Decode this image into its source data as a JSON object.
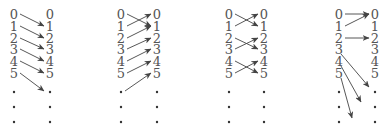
{
  "diagrams": [
    {
      "id": "shift-up",
      "left_x": 14,
      "right_x": 50,
      "labels": [
        "0",
        "1",
        "2",
        "3",
        "4",
        "5"
      ],
      "mapping": [
        [
          0,
          1
        ],
        [
          1,
          2
        ],
        [
          2,
          3
        ],
        [
          3,
          4
        ],
        [
          4,
          5
        ],
        [
          5,
          6
        ]
      ]
    },
    {
      "id": "shift-down",
      "left_x": 121,
      "right_x": 157,
      "labels": [
        "0",
        "1",
        "2",
        "3",
        "4",
        "5"
      ],
      "mapping": [
        [
          0,
          1
        ],
        [
          1,
          0
        ],
        [
          2,
          1
        ],
        [
          3,
          2
        ],
        [
          4,
          3
        ],
        [
          5,
          4
        ],
        [
          6,
          5
        ]
      ]
    },
    {
      "id": "pair-swap",
      "left_x": 229,
      "right_x": 264,
      "labels": [
        "0",
        "1",
        "2",
        "3",
        "4",
        "5"
      ],
      "mapping": [
        [
          0,
          1
        ],
        [
          1,
          0
        ],
        [
          2,
          3
        ],
        [
          3,
          2
        ],
        [
          4,
          5
        ],
        [
          5,
          4
        ]
      ]
    },
    {
      "id": "collapse-and-escape",
      "left_x": 339,
      "right_x": 375,
      "labels": [
        "0",
        "1",
        "2",
        "3",
        "4",
        "5"
      ],
      "mapping": [
        [
          0,
          0
        ],
        [
          1,
          0
        ],
        [
          2,
          2
        ],
        [
          3,
          6
        ],
        [
          4,
          7
        ],
        [
          5,
          8
        ]
      ]
    }
  ],
  "row_y": [
    15,
    27,
    39,
    50,
    62,
    74
  ],
  "dot_y": [
    92,
    107,
    122
  ],
  "colors": {
    "text": "#555555",
    "arrow": "#444444",
    "dot": "#333333"
  }
}
